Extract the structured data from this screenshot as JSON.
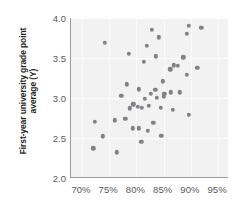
{
  "chart_data": {
    "type": "scatter",
    "title": "",
    "subtitle": "",
    "xlabel": "",
    "ylabel": "First-year university grade point average (Y)",
    "xlim": [
      68.0,
      97.0
    ],
    "ylim": [
      2.0,
      4.0
    ],
    "grid": true,
    "legend": null,
    "x_tick_labels": [
      "70%",
      "75%",
      "80%",
      "85%",
      "90%",
      "95%"
    ],
    "x_tick_values": [
      70,
      75,
      80,
      85,
      90,
      95
    ],
    "y_tick_labels": [
      "4.0",
      "3.5",
      "3.0",
      "2.5",
      "2.0"
    ],
    "y_tick_values": [
      4.0,
      3.5,
      3.0,
      2.5,
      2.0
    ],
    "x_unit": "percent",
    "marker_color": "#808285",
    "plot_background": "#f2f2f2",
    "axis_color": "#9a9a9a",
    "points": [
      {
        "x": 74.2,
        "y": 3.69
      },
      {
        "x": 78.6,
        "y": 3.55
      },
      {
        "x": 82.8,
        "y": 3.85
      },
      {
        "x": 84.1,
        "y": 3.76
      },
      {
        "x": 81.9,
        "y": 3.65
      },
      {
        "x": 89.6,
        "y": 3.9
      },
      {
        "x": 91.9,
        "y": 3.88
      },
      {
        "x": 89.2,
        "y": 3.8
      },
      {
        "x": 83.6,
        "y": 3.52
      },
      {
        "x": 88.6,
        "y": 3.51
      },
      {
        "x": 81.4,
        "y": 3.45
      },
      {
        "x": 86.9,
        "y": 3.41
      },
      {
        "x": 87.6,
        "y": 3.4
      },
      {
        "x": 91.2,
        "y": 3.38
      },
      {
        "x": 86.2,
        "y": 3.36
      },
      {
        "x": 89.3,
        "y": 3.29
      },
      {
        "x": 84.8,
        "y": 3.21
      },
      {
        "x": 78.2,
        "y": 3.17
      },
      {
        "x": 80.4,
        "y": 3.11
      },
      {
        "x": 83.5,
        "y": 3.1
      },
      {
        "x": 86.3,
        "y": 3.07
      },
      {
        "x": 88.0,
        "y": 3.07
      },
      {
        "x": 82.6,
        "y": 3.05
      },
      {
        "x": 85.1,
        "y": 3.05
      },
      {
        "x": 77.2,
        "y": 3.03
      },
      {
        "x": 85.0,
        "y": 3.02
      },
      {
        "x": 83.7,
        "y": 3.0
      },
      {
        "x": 81.6,
        "y": 2.99
      },
      {
        "x": 79.4,
        "y": 2.92
      },
      {
        "x": 82.3,
        "y": 2.9
      },
      {
        "x": 80.3,
        "y": 2.89
      },
      {
        "x": 81.0,
        "y": 2.88
      },
      {
        "x": 84.5,
        "y": 2.88
      },
      {
        "x": 78.8,
        "y": 2.87
      },
      {
        "x": 86.7,
        "y": 2.85
      },
      {
        "x": 89.6,
        "y": 2.79
      },
      {
        "x": 78.0,
        "y": 2.74
      },
      {
        "x": 76.0,
        "y": 2.72
      },
      {
        "x": 72.4,
        "y": 2.7
      },
      {
        "x": 83.1,
        "y": 2.69
      },
      {
        "x": 79.3,
        "y": 2.62
      },
      {
        "x": 80.4,
        "y": 2.62
      },
      {
        "x": 82.1,
        "y": 2.59
      },
      {
        "x": 84.6,
        "y": 2.53
      },
      {
        "x": 73.8,
        "y": 2.52
      },
      {
        "x": 80.9,
        "y": 2.45
      },
      {
        "x": 72.1,
        "y": 2.37
      },
      {
        "x": 76.4,
        "y": 2.32
      }
    ]
  }
}
